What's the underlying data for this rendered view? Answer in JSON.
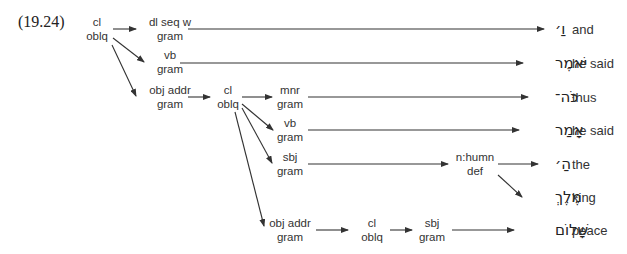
{
  "example_number": "(19.24)",
  "nodes": {
    "root": {
      "line1": "cl",
      "line2": "oblq"
    },
    "dl": {
      "line1": "dl seq w",
      "line2": "gram"
    },
    "vb1": {
      "line1": "vb",
      "line2": "gram"
    },
    "objaddr1": {
      "line1": "obj addr",
      "line2": "gram"
    },
    "cl2": {
      "line1": "cl",
      "line2": "oblq"
    },
    "mnr": {
      "line1": "mnr",
      "line2": "gram"
    },
    "vb2": {
      "line1": "vb",
      "line2": "gram"
    },
    "sbj1": {
      "line1": "sbj",
      "line2": "gram"
    },
    "nhumn": {
      "line1": "n:humn",
      "line2": "def"
    },
    "objaddr2": {
      "line1": "obj addr",
      "line2": "gram"
    },
    "cl3": {
      "line1": "cl",
      "line2": "oblq"
    },
    "sbj2": {
      "line1": "sbj",
      "line2": "gram"
    }
  },
  "words": [
    {
      "hebrew": "וַ׳",
      "gloss": "and"
    },
    {
      "hebrew": "יֹּאמֶר",
      "gloss": "he said"
    },
    {
      "hebrew": "כֹּה־",
      "gloss": "thus"
    },
    {
      "hebrew": "אָמַר",
      "gloss": "he said"
    },
    {
      "hebrew": "הַ׳",
      "gloss": "the"
    },
    {
      "hebrew": "מֶּלֶךְ",
      "gloss": "king"
    },
    {
      "hebrew": "שָׁלוֹם",
      "gloss": "peace"
    }
  ]
}
